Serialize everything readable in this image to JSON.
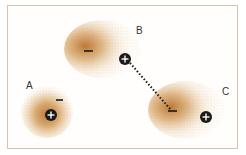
{
  "diagram": {
    "colors": {
      "cloud": "#c8883a",
      "cloud_dense": "#b8702a",
      "border": "#d8c3a8",
      "charge": "#1a1a1a"
    },
    "molecules": [
      {
        "id": "A",
        "label": "A",
        "partial_negative": "−",
        "partial_positive": "+"
      },
      {
        "id": "B",
        "label": "B",
        "partial_negative": "−",
        "partial_positive": "+"
      },
      {
        "id": "C",
        "label": "C",
        "partial_negative": "−",
        "partial_positive": "+"
      }
    ],
    "interaction": "dotted line from B(+) to C(−)"
  }
}
